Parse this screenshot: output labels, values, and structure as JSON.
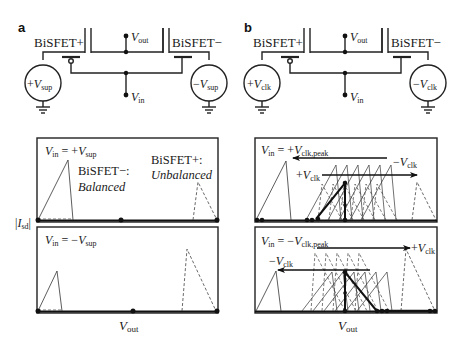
{
  "panels": [
    {
      "letter": "a",
      "circuit": {
        "left_device": "BiSFET+",
        "right_device": "BiSFET−",
        "left_source_sign": "+",
        "left_source_var": "V",
        "left_source_sub": "sup",
        "right_source_sign": "−",
        "right_source_var": "V",
        "right_source_sub": "sup",
        "out_var": "V",
        "out_sub": "out",
        "in_var": "V",
        "in_sub": "in"
      },
      "plots": [
        {
          "cond_var": "V",
          "cond_sub": "in",
          "cond_eq": " = +",
          "cond_rhs_var": "V",
          "cond_rhs_sub": "sup",
          "notes": [
            {
              "line1": "BiSFET−:",
              "line2": "Balanced"
            },
            {
              "line1": "BiSFET+:",
              "line2": "Unbalanced"
            }
          ]
        },
        {
          "cond_var": "V",
          "cond_sub": "in",
          "cond_eq": " = −",
          "cond_rhs_var": "V",
          "cond_rhs_sub": "sup"
        }
      ],
      "xlabel_var": "V",
      "xlabel_sub": "out"
    },
    {
      "letter": "b",
      "circuit": {
        "left_device": "BiSFET+",
        "right_device": "BiSFET−",
        "left_source_sign": "+",
        "left_source_var": "V",
        "left_source_sub": "clk",
        "right_source_sign": "−",
        "right_source_var": "V",
        "right_source_sub": "clk",
        "out_var": "V",
        "out_sub": "out",
        "in_var": "V",
        "in_sub": "in"
      },
      "plots": [
        {
          "cond_var": "V",
          "cond_sub": "in",
          "cond_eq": " = +",
          "cond_rhs_var": "V",
          "cond_rhs_sub": "clk,peak",
          "arrow_labels": [
            {
              "sign": "−",
              "var": "V",
              "sub": "clk"
            },
            {
              "sign": "+",
              "var": "V",
              "sub": "clk"
            }
          ]
        },
        {
          "cond_var": "V",
          "cond_sub": "in",
          "cond_eq": " = −",
          "cond_rhs_var": "V",
          "cond_rhs_sub": "clk,peak",
          "arrow_labels": [
            {
              "sign": "+",
              "var": "V",
              "sub": "clk"
            },
            {
              "sign": "−",
              "var": "V",
              "sub": "clk"
            }
          ]
        }
      ],
      "xlabel_var": "V",
      "xlabel_sub": "out"
    }
  ],
  "ylabel": {
    "var": "I",
    "sub": "sd"
  }
}
